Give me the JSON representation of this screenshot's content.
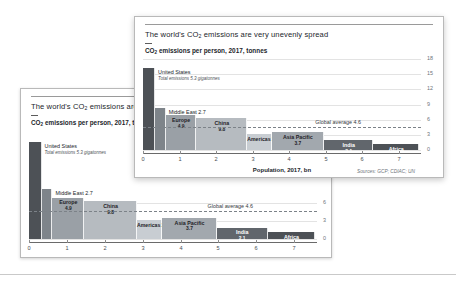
{
  "chart_data": {
    "type": "bar",
    "subtitle": "CO₂ emissions per person, 2017, tonnes",
    "xlabel": "Population, 2017, bn",
    "ylabel": "CO₂ emissions per person, 2017, tonnes",
    "source": "Sources: GCP; CDIAC; UN",
    "xlim": [
      0,
      7.6
    ],
    "ylim": [
      0,
      18
    ],
    "xticks": [
      "0",
      "1",
      "2",
      "3",
      "4",
      "5",
      "6",
      "7"
    ],
    "yticks": [
      "18",
      "15",
      "12",
      "9",
      "6",
      "3",
      "0"
    ],
    "grid": true,
    "legend": "none",
    "annotations": [
      {
        "name": "united-states",
        "label": "United States",
        "detail": "Total emissions 5.3 gigatonnes"
      },
      {
        "name": "middle-east",
        "label": "Middle East 2.7"
      },
      {
        "name": "global-average",
        "label": "Global average 4.6",
        "value": 4.6
      }
    ],
    "categories": [
      "United States",
      "Middle East",
      "Europe",
      "China",
      "Americas",
      "Asia Pacific",
      "India",
      "Africa"
    ],
    "bars": [
      {
        "name": "united-states",
        "label": "United States",
        "value_label": "",
        "emissions_per_person": 16.2,
        "population_start": 0,
        "population_end": 0.33,
        "color": "#4d5156",
        "label_inside": false,
        "label_position": "outside-right",
        "text_color": "#22262b"
      },
      {
        "name": "middle-east",
        "label": "Middle East",
        "value_label": "2.7",
        "emissions_per_person": 8.3,
        "population_start": 0.33,
        "population_end": 0.62,
        "color": "#7e848a",
        "label_inside": false,
        "label_position": "outside-right",
        "text_color": "#22262b"
      },
      {
        "name": "europe",
        "label": "Europe",
        "value_label": "4.9",
        "emissions_per_person": 6.9,
        "population_start": 0.62,
        "population_end": 1.46,
        "color": "#9aa0a6",
        "label_inside": true,
        "label_position": "inside",
        "text_color": "#1f2328"
      },
      {
        "name": "china",
        "label": "China",
        "value_label": "9.8",
        "emissions_per_person": 6.3,
        "population_start": 1.46,
        "population_end": 2.85,
        "color": "#b6bbc0",
        "label_inside": true,
        "label_position": "inside",
        "text_color": "#1f2328"
      },
      {
        "name": "americas",
        "label": "Americas",
        "value_label": "2.4",
        "emissions_per_person": 3.1,
        "population_start": 2.85,
        "population_end": 3.52,
        "color": "#c8cdd2",
        "label_inside": true,
        "label_position": "inside",
        "text_color": "#1f2328"
      },
      {
        "name": "asia-pacific",
        "label": "Asia Pacific",
        "value_label": "3.7",
        "emissions_per_person": 3.5,
        "population_start": 3.52,
        "population_end": 4.95,
        "color": "#a2a8ae",
        "label_inside": true,
        "label_position": "inside",
        "text_color": "#1f2328"
      },
      {
        "name": "india",
        "label": "India",
        "value_label": "2.1",
        "emissions_per_person": 1.9,
        "population_start": 4.95,
        "population_end": 6.3,
        "color": "#61666c",
        "label_inside": true,
        "label_position": "inside",
        "text_color": "#ffffff"
      },
      {
        "name": "africa",
        "label": "Africa",
        "value_label": "1.3",
        "emissions_per_person": 1.1,
        "population_start": 6.3,
        "population_end": 7.55,
        "color": "#4d5156",
        "label_inside": true,
        "label_position": "inside",
        "text_color": "#ffffff"
      }
    ]
  },
  "front_card": {
    "name": "front-chart-card",
    "title": "The world's CO₂ emissions are very unevenly spread",
    "subtitle": "CO₂ emissions per person, 2017, tonnes",
    "xlabel": "Population, 2017, bn",
    "source": "Sources: GCP; CDIAC; UN",
    "yticks": [
      "18",
      "15",
      "12",
      "9",
      "6",
      "3",
      "0"
    ],
    "xticks": [
      "0",
      "1",
      "2",
      "3",
      "4",
      "5",
      "6",
      "7"
    ]
  },
  "back_card": {
    "name": "back-chart-card",
    "title": "The world's CO₂ emissions are ver",
    "subtitle": "CO₂ emissions per person, 2017, tonnes",
    "xlabel": "Population, 2017, bn",
    "source": "Sources: GCP; CDIAC; UN",
    "yticks": [
      "6",
      "3",
      "0"
    ],
    "xticks": [
      "0",
      "1",
      "2",
      "3",
      "4",
      "5",
      "6",
      "7"
    ]
  }
}
